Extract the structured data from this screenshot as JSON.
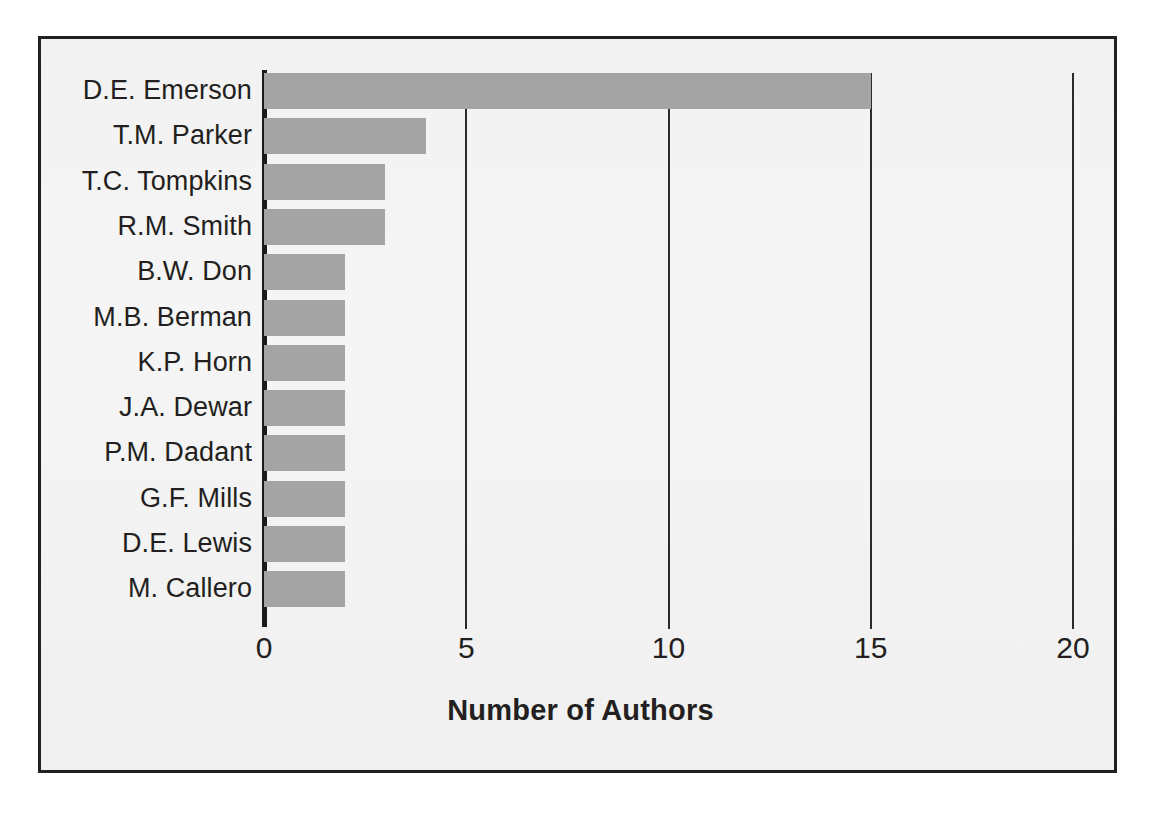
{
  "figure": {
    "background_color": "#ffffff",
    "frame_color": "#231f20",
    "plot_background_color": "#f4f4f4"
  },
  "chart_data": {
    "type": "bar",
    "orientation": "horizontal",
    "title": "",
    "xlabel": "Number of Authors",
    "ylabel": "",
    "xlim": [
      0,
      20
    ],
    "ylim": null,
    "grid": true,
    "grid_axis": "x",
    "legend": false,
    "bar_color": "#a6a6a6",
    "xticks": [
      0,
      5,
      10,
      15,
      20
    ],
    "xtick_labels": [
      "0",
      "5",
      "10",
      "15",
      "20"
    ],
    "categories": [
      "D.E. Emerson",
      "T.M. Parker",
      "T.C. Tompkins",
      "R.M. Smith",
      "B.W. Don",
      "M.B. Berman",
      "K.P. Horn",
      "J.A. Dewar",
      "P.M. Dadant",
      "G.F. Mills",
      "D.E. Lewis",
      "M. Callero"
    ],
    "values": [
      15,
      4,
      3,
      3,
      2,
      2,
      2,
      2,
      2,
      2,
      2,
      2
    ]
  }
}
